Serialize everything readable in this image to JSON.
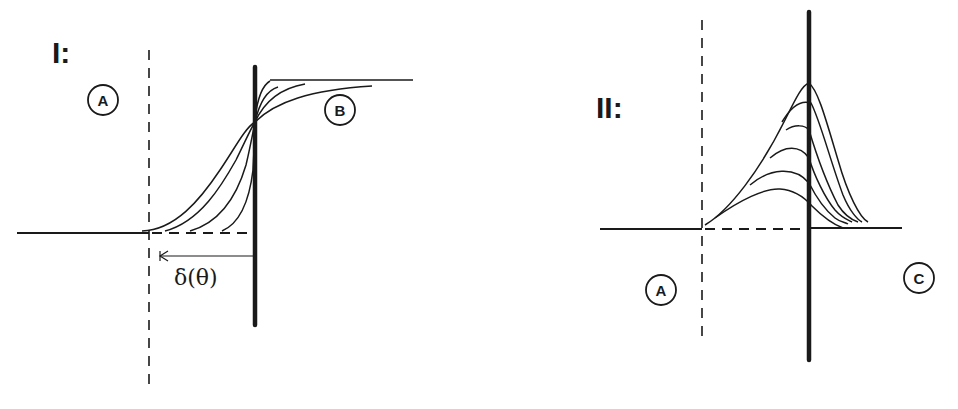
{
  "figure": {
    "ink_color": "#1a1a1a",
    "background": "#ffffff"
  },
  "panel_1": {
    "label": "I:",
    "regions": [
      {
        "id": "A",
        "label": "A"
      },
      {
        "id": "B",
        "label": "B"
      }
    ],
    "dimension_label": "δ(θ)",
    "curve_count": 5,
    "description": "Family of S-shaped profiles that all pass through one point on the thick interface line. The lower parts start at progressively larger offsets from the dashed boundary, and the upper parts level off to the right."
  },
  "panel_2": {
    "label": "II:",
    "regions": [
      {
        "id": "A",
        "label": "A"
      },
      {
        "id": "C",
        "label": "C"
      }
    ],
    "curve_count": 6,
    "description": "Family of peaked profiles. Peak heights rise toward the thick interface line, and the tails decay to the right."
  }
}
